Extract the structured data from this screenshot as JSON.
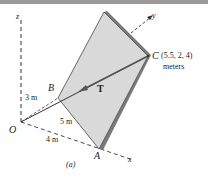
{
  "figure": {
    "caption": "(a)",
    "axes": {
      "x": "x",
      "y": "y",
      "z": "z"
    },
    "points": {
      "O": "O",
      "A": "A",
      "B": "B",
      "C": "C",
      "C_coords": "(5.5, 2, 4)",
      "C_units": "meters"
    },
    "dimensions": {
      "OB": "3 m",
      "AB": "5 m",
      "OA": "4 m"
    },
    "force_label": "T"
  }
}
